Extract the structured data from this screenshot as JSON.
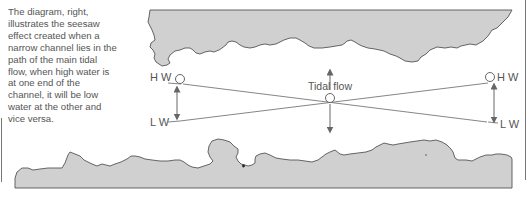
{
  "caption": {
    "lines": [
      "The diagram, right,",
      "illustrates the seesaw",
      "effect created when a",
      "narrow channel lies in the",
      "path of the main tidal",
      "flow, when high water is",
      "at one end of the",
      "channel, it will be low",
      "water at the other and",
      "vice versa."
    ]
  },
  "diagram": {
    "left_high_label": "H W",
    "left_low_label": "L W",
    "right_high_label": "H W",
    "right_low_label": "L W",
    "center_label": "Tidal flow",
    "colors": {
      "land_fill": "#d0d0d0",
      "land_stroke": "#555555",
      "line": "#777777",
      "arrow": "#666666"
    }
  }
}
